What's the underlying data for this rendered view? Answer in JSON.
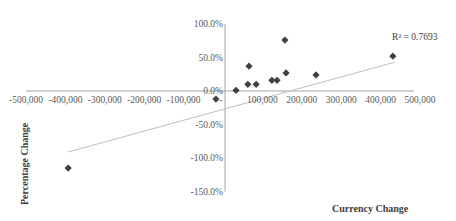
{
  "chart_data": {
    "type": "scatter",
    "title": "",
    "xlabel": "Currency Change",
    "ylabel": "Percentage Change",
    "xlim": [
      -500000,
      500000
    ],
    "ylim": [
      -1.5,
      1.0
    ],
    "x_ticks": [
      "-500,000",
      "-400,000",
      "-300,000",
      "-200,000",
      "-100,000",
      "",
      "100,000",
      "200,000",
      "300,000",
      "400,000",
      "500,000"
    ],
    "x_tick_values": [
      -500000,
      -400000,
      -300000,
      -200000,
      -100000,
      0,
      100000,
      200000,
      300000,
      400000,
      500000
    ],
    "y_ticks": [
      "100.0%",
      "50.0%",
      "0.0%",
      "-50.0%",
      "-100.0%",
      "-150.0%"
    ],
    "y_tick_values": [
      1.0,
      0.5,
      0.0,
      -0.5,
      -1.0,
      -1.5
    ],
    "grid": false,
    "legend": null,
    "series": [
      {
        "name": "Data",
        "marker": "diamond",
        "color": "#404040",
        "points": [
          {
            "x": -398000,
            "y": -1.15
          },
          {
            "x": -23000,
            "y": -0.12
          },
          {
            "x": 28000,
            "y": 0.01
          },
          {
            "x": 58000,
            "y": 0.1
          },
          {
            "x": 61000,
            "y": 0.37
          },
          {
            "x": 79000,
            "y": 0.1
          },
          {
            "x": 119000,
            "y": 0.16
          },
          {
            "x": 132000,
            "y": 0.16
          },
          {
            "x": 152000,
            "y": 0.76
          },
          {
            "x": 155000,
            "y": 0.27
          },
          {
            "x": 231000,
            "y": 0.24
          },
          {
            "x": 426000,
            "y": 0.52
          }
        ]
      }
    ],
    "trendline": {
      "type": "linear",
      "color": "#bfbfbf",
      "from": {
        "x": -398000,
        "y": -0.91
      },
      "to": {
        "x": 431000,
        "y": 0.43
      },
      "r_squared_label": "R² = 0.7693"
    }
  }
}
